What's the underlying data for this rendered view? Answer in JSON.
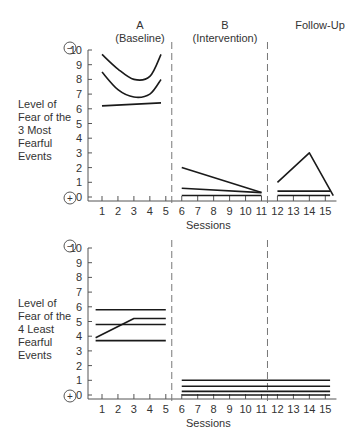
{
  "figure": {
    "phase_labels": [
      {
        "title": "A",
        "subtitle": "(Baseline)"
      },
      {
        "title": "B",
        "subtitle": "(Intervention)"
      },
      {
        "title": "Follow-Up",
        "subtitle": ""
      }
    ],
    "top_ylabel": [
      "Level of",
      "Fear of the",
      "3 Most",
      "Fearful",
      "Events"
    ],
    "bottom_ylabel": [
      "Level of",
      "Fear of the",
      "4 Least",
      "Fearful",
      "Events"
    ],
    "xlabel": "Sessions",
    "minus_symbol": "−",
    "plus_symbol": "+"
  },
  "chart_data": [
    {
      "type": "line",
      "title": "Level of Fear of the 3 Most Fearful Events",
      "xlabel": "Sessions",
      "ylabel": "Level of Fear of the 3 Most Fearful Events",
      "x_ticks": [
        1,
        2,
        3,
        4,
        5,
        6,
        7,
        8,
        9,
        10,
        11,
        12,
        13,
        14,
        15
      ],
      "y_ticks": [
        0,
        1,
        2,
        3,
        4,
        5,
        6,
        7,
        8,
        9,
        10
      ],
      "ylim": [
        0,
        10
      ],
      "xlim": [
        0,
        15.5
      ],
      "grid": false,
      "phase_lines_at": [
        5.5,
        11.5
      ],
      "phases": [
        "A (Baseline)",
        "B (Intervention)",
        "Follow-Up"
      ],
      "y_annotations": {
        "top": "−",
        "bottom": "+"
      },
      "series": [
        {
          "name": "Event 1",
          "phase": "A",
          "smooth": true,
          "points": [
            [
              1,
              9.7
            ],
            [
              2,
              8.7
            ],
            [
              3,
              8.0
            ],
            [
              4,
              8.2
            ],
            [
              4.7,
              9.7
            ]
          ]
        },
        {
          "name": "Event 2",
          "phase": "A",
          "smooth": true,
          "points": [
            [
              1,
              8.5
            ],
            [
              2,
              7.3
            ],
            [
              3,
              6.8
            ],
            [
              4,
              7.0
            ],
            [
              4.7,
              8.0
            ]
          ]
        },
        {
          "name": "Event 3",
          "phase": "A",
          "smooth": false,
          "points": [
            [
              1,
              6.2
            ],
            [
              4.7,
              6.4
            ]
          ]
        },
        {
          "name": "Event 1",
          "phase": "B",
          "smooth": false,
          "points": [
            [
              6,
              2.0
            ],
            [
              11,
              0.3
            ]
          ]
        },
        {
          "name": "Event 2",
          "phase": "B",
          "smooth": false,
          "points": [
            [
              6,
              0.6
            ],
            [
              11,
              0.3
            ]
          ]
        },
        {
          "name": "Event 3",
          "phase": "B",
          "smooth": false,
          "points": [
            [
              6,
              0.1
            ],
            [
              11,
              0.1
            ]
          ]
        },
        {
          "name": "Event 1",
          "phase": "Follow-Up",
          "smooth": false,
          "points": [
            [
              12,
              1.0
            ],
            [
              14,
              3.0
            ],
            [
              15.5,
              0.1
            ]
          ]
        },
        {
          "name": "Event 2",
          "phase": "Follow-Up",
          "smooth": false,
          "points": [
            [
              12,
              0.4
            ],
            [
              15.3,
              0.4
            ]
          ]
        },
        {
          "name": "Event 3",
          "phase": "Follow-Up",
          "smooth": false,
          "points": [
            [
              12,
              0.1
            ],
            [
              15.3,
              0.1
            ]
          ]
        }
      ]
    },
    {
      "type": "line",
      "title": "Level of Fear of the 4 Least Fearful Events",
      "xlabel": "Sessions",
      "ylabel": "Level of Fear of the 4 Least Fearful Events",
      "x_ticks": [
        1,
        2,
        3,
        4,
        5,
        6,
        7,
        8,
        9,
        10,
        11,
        12,
        13,
        14,
        15
      ],
      "y_ticks": [
        0,
        1,
        2,
        3,
        4,
        5,
        6,
        7,
        8,
        9,
        10
      ],
      "ylim": [
        0,
        10
      ],
      "xlim": [
        0,
        15.5
      ],
      "grid": false,
      "phase_lines_at": [
        5.5,
        11.5
      ],
      "phases": [
        "A (Baseline)",
        "B (Intervention)",
        "Follow-Up"
      ],
      "y_annotations": {
        "top": "−",
        "bottom": "+"
      },
      "series": [
        {
          "name": "Event 1",
          "phase": "A",
          "smooth": false,
          "points": [
            [
              0.6,
              5.8
            ],
            [
              5,
              5.8
            ]
          ]
        },
        {
          "name": "Event 2",
          "phase": "A",
          "smooth": false,
          "points": [
            [
              0.6,
              4.8
            ],
            [
              5,
              4.8
            ]
          ]
        },
        {
          "name": "Event 3",
          "phase": "A",
          "smooth": false,
          "points": [
            [
              0.6,
              3.9
            ],
            [
              3,
              5.2
            ],
            [
              5,
              5.2
            ]
          ]
        },
        {
          "name": "Event 4",
          "phase": "A",
          "smooth": false,
          "points": [
            [
              0.6,
              3.7
            ],
            [
              5,
              3.7
            ]
          ]
        },
        {
          "name": "Event 1",
          "phase": "B+Follow-Up",
          "smooth": false,
          "points": [
            [
              6,
              1.0
            ],
            [
              15.3,
              1.0
            ]
          ]
        },
        {
          "name": "Event 2",
          "phase": "B+Follow-Up",
          "smooth": false,
          "points": [
            [
              6,
              0.6
            ],
            [
              15.3,
              0.6
            ]
          ]
        },
        {
          "name": "Event 3",
          "phase": "B+Follow-Up",
          "smooth": false,
          "points": [
            [
              6,
              0.25
            ],
            [
              15.3,
              0.25
            ]
          ]
        },
        {
          "name": "Event 4",
          "phase": "B+Follow-Up",
          "smooth": false,
          "points": [
            [
              6,
              0.0
            ],
            [
              15.3,
              0.0
            ]
          ]
        }
      ]
    }
  ]
}
